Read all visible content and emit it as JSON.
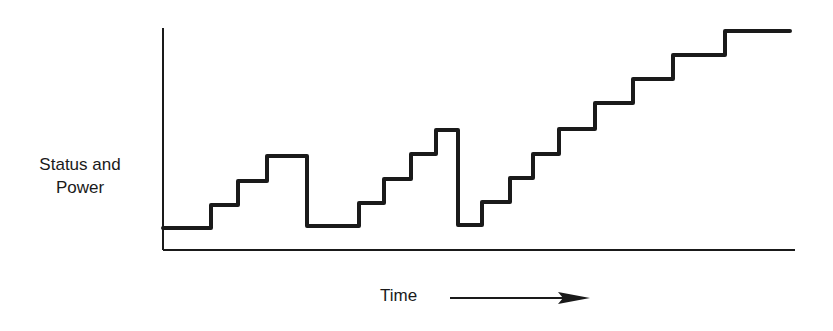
{
  "chart_data": {
    "type": "line",
    "subtype": "step",
    "title": "",
    "xlabel": "Time",
    "ylabel": "Status and Power",
    "xlabel_has_arrow": true,
    "grid": false,
    "legend": null,
    "axes": {
      "x_origin_px": 163,
      "y_origin_px": 250,
      "x_end_px": 795,
      "y_top_px": 28
    },
    "steps": [
      {
        "x": 163,
        "y": 228
      },
      {
        "x": 211,
        "y": 228
      },
      {
        "x": 211,
        "y": 205
      },
      {
        "x": 238,
        "y": 205
      },
      {
        "x": 238,
        "y": 181
      },
      {
        "x": 267,
        "y": 181
      },
      {
        "x": 267,
        "y": 156
      },
      {
        "x": 307,
        "y": 156
      },
      {
        "x": 307,
        "y": 226
      },
      {
        "x": 359,
        "y": 226
      },
      {
        "x": 359,
        "y": 203
      },
      {
        "x": 384,
        "y": 203
      },
      {
        "x": 384,
        "y": 179
      },
      {
        "x": 411,
        "y": 179
      },
      {
        "x": 411,
        "y": 154
      },
      {
        "x": 436,
        "y": 154
      },
      {
        "x": 436,
        "y": 130
      },
      {
        "x": 458,
        "y": 130
      },
      {
        "x": 458,
        "y": 225
      },
      {
        "x": 482,
        "y": 225
      },
      {
        "x": 482,
        "y": 202
      },
      {
        "x": 510,
        "y": 202
      },
      {
        "x": 510,
        "y": 178
      },
      {
        "x": 533,
        "y": 178
      },
      {
        "x": 533,
        "y": 154
      },
      {
        "x": 559,
        "y": 154
      },
      {
        "x": 559,
        "y": 129
      },
      {
        "x": 595,
        "y": 129
      },
      {
        "x": 595,
        "y": 103
      },
      {
        "x": 633,
        "y": 103
      },
      {
        "x": 633,
        "y": 79
      },
      {
        "x": 673,
        "y": 79
      },
      {
        "x": 673,
        "y": 55
      },
      {
        "x": 725,
        "y": 55
      },
      {
        "x": 725,
        "y": 31
      },
      {
        "x": 790,
        "y": 31
      }
    ],
    "relative_levels": [
      0,
      1,
      2,
      3,
      0,
      1,
      2,
      3,
      4,
      0,
      1,
      2,
      3,
      4,
      5,
      6,
      7,
      8
    ],
    "phases": [
      {
        "description": "rise 3 steps then drop to base"
      },
      {
        "description": "rise 4 steps then drop to base"
      },
      {
        "description": "rise 8 steps continuously"
      }
    ]
  },
  "labels": {
    "y_line1": "Status and",
    "y_line2": "Power",
    "x": "Time"
  },
  "colors": {
    "line": "#1a1a1a",
    "background": "#ffffff"
  }
}
